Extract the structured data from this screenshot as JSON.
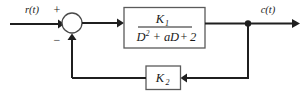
{
  "diagram": {
    "type": "control-block-diagram",
    "background_color": "#ffffff",
    "line_color": "#1f1f1f",
    "box_stroke_color": "#5a5a5a",
    "signals": {
      "input_label": "r(t)",
      "output_label": "c(t)"
    },
    "summing_junction": {
      "name": "summing-junction",
      "plus_sign": "+",
      "minus_sign": "−",
      "shape": "circle",
      "center_x": 72,
      "center_y": 23,
      "radius": 10
    },
    "forward_block": {
      "name": "forward-transfer-function",
      "numerator": "K",
      "numerator_subscript": "1",
      "denominator_terms": [
        "D",
        "2",
        "+",
        "a",
        "D",
        "+",
        "2"
      ],
      "denominator_text": "D² + aD + 2",
      "full_expression": "K₁ / (D² + aD + 2)"
    },
    "feedback_block": {
      "name": "feedback-gain-block",
      "gain": "K",
      "gain_subscript": "2",
      "full_expression": "K₂"
    },
    "takeoff_node": {
      "name": "output-takeoff-node",
      "x": 248,
      "y": 24
    }
  }
}
